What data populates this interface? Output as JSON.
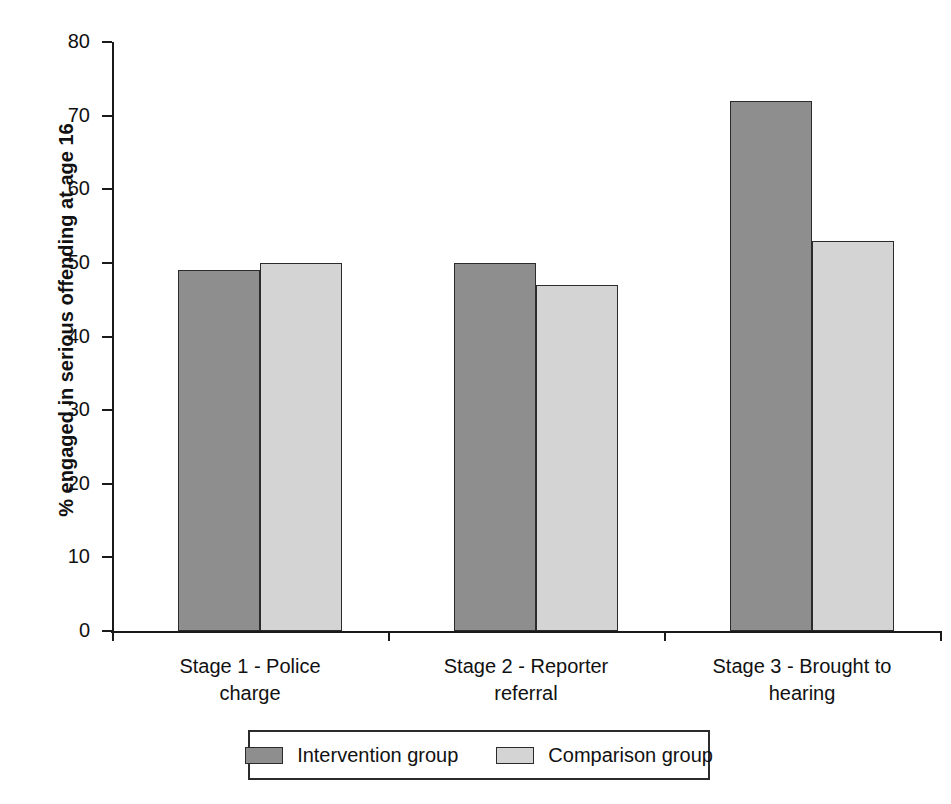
{
  "chart_data": {
    "type": "bar",
    "title": "",
    "xlabel": "",
    "ylabel": "% engaged in serious offending at age 16",
    "ylim": [
      0,
      80
    ],
    "ytick_step": 10,
    "yticks": [
      0,
      10,
      20,
      30,
      40,
      50,
      60,
      70,
      80
    ],
    "grid": false,
    "legend_position": "bottom",
    "categories": [
      "Stage 1 - Police charge",
      "Stage 2 - Reporter referral",
      "Stage 3 - Brought to hearing"
    ],
    "category_lines": [
      [
        "Stage 1 - Police",
        "charge"
      ],
      [
        "Stage 2 - Reporter",
        "referral"
      ],
      [
        "Stage 3 - Brought to",
        "hearing"
      ]
    ],
    "series": [
      {
        "name": "Intervention group",
        "color": "#8e8e8e",
        "values": [
          49,
          50,
          72
        ]
      },
      {
        "name": "Comparison group",
        "color": "#d4d4d4",
        "values": [
          50,
          47,
          53
        ]
      }
    ]
  },
  "axis": {
    "tick_labels": [
      "80",
      "70",
      "60",
      "50",
      "40",
      "30",
      "20",
      "10",
      "0"
    ]
  },
  "legend": {
    "entries": [
      {
        "label": "Intervention group",
        "swatch": "dark"
      },
      {
        "label": "Comparison group",
        "swatch": "light"
      }
    ]
  }
}
